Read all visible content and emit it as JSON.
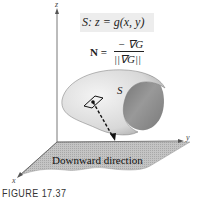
{
  "figure": {
    "caption": "FIGURE 17.37",
    "surface_equation": "S:  z = g(x, y)",
    "normal_equation": {
      "lhs": "N =",
      "numerator": "− ∇G",
      "denominator": "||∇G||"
    },
    "surface_label": "S",
    "plane_label": "Downward direction",
    "axes": {
      "z": "z",
      "y": "y",
      "x": "x"
    },
    "colors": {
      "surface_light": "#e6e6e6",
      "surface_dark": "#8c8c8c",
      "plane": "#b9b9b9",
      "equation_box": "#ededed",
      "axis": "#555555"
    }
  }
}
